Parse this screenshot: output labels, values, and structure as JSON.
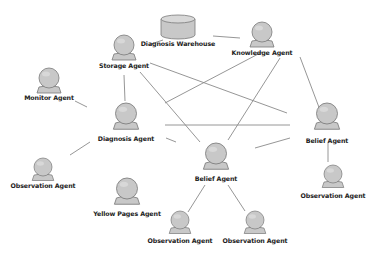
{
  "diagram": {
    "nodes": [
      {
        "id": "storage",
        "type": "agent",
        "label": "Storage Agent"
      },
      {
        "id": "warehouse",
        "type": "database",
        "label": "Diagnosis Warehouse"
      },
      {
        "id": "knowledge",
        "type": "agent",
        "label": "Knowledge Agent"
      },
      {
        "id": "monitor",
        "type": "agent",
        "label": "Monitor Agent"
      },
      {
        "id": "diagnosis",
        "type": "agent",
        "label": "Diagnosis Agent"
      },
      {
        "id": "belief_right",
        "type": "agent",
        "label": "Belief Agent"
      },
      {
        "id": "observation_left",
        "type": "agent",
        "label": "Observation Agent"
      },
      {
        "id": "belief_center",
        "type": "agent",
        "label": "Belief Agent"
      },
      {
        "id": "yellow_pages",
        "type": "agent",
        "label": "Yellow Pages Agent"
      },
      {
        "id": "observation_right",
        "type": "agent",
        "label": "Observation Agent"
      },
      {
        "id": "observation_bottom_left",
        "type": "agent",
        "label": "Observation Agent"
      },
      {
        "id": "observation_bottom_right",
        "type": "agent",
        "label": "Observation Agent"
      }
    ],
    "edges": [
      [
        "storage",
        "warehouse"
      ],
      [
        "warehouse",
        "knowledge"
      ],
      [
        "storage",
        "diagnosis"
      ],
      [
        "storage",
        "belief_center"
      ],
      [
        "storage",
        "belief_right"
      ],
      [
        "knowledge",
        "diagnosis"
      ],
      [
        "knowledge",
        "belief_center"
      ],
      [
        "knowledge",
        "belief_right"
      ],
      [
        "monitor",
        "diagnosis"
      ],
      [
        "diagnosis",
        "belief_right"
      ],
      [
        "diagnosis",
        "belief_center"
      ],
      [
        "diagnosis",
        "observation_left"
      ],
      [
        "belief_center",
        "belief_right"
      ],
      [
        "belief_right",
        "observation_right"
      ],
      [
        "belief_center",
        "observation_bottom_left"
      ],
      [
        "belief_center",
        "observation_bottom_right"
      ]
    ]
  },
  "colors": {
    "node_fill": "#c8c8c8",
    "node_stroke": "#7a7a7a",
    "edge": "#8a8a8a",
    "label": "#222222"
  }
}
